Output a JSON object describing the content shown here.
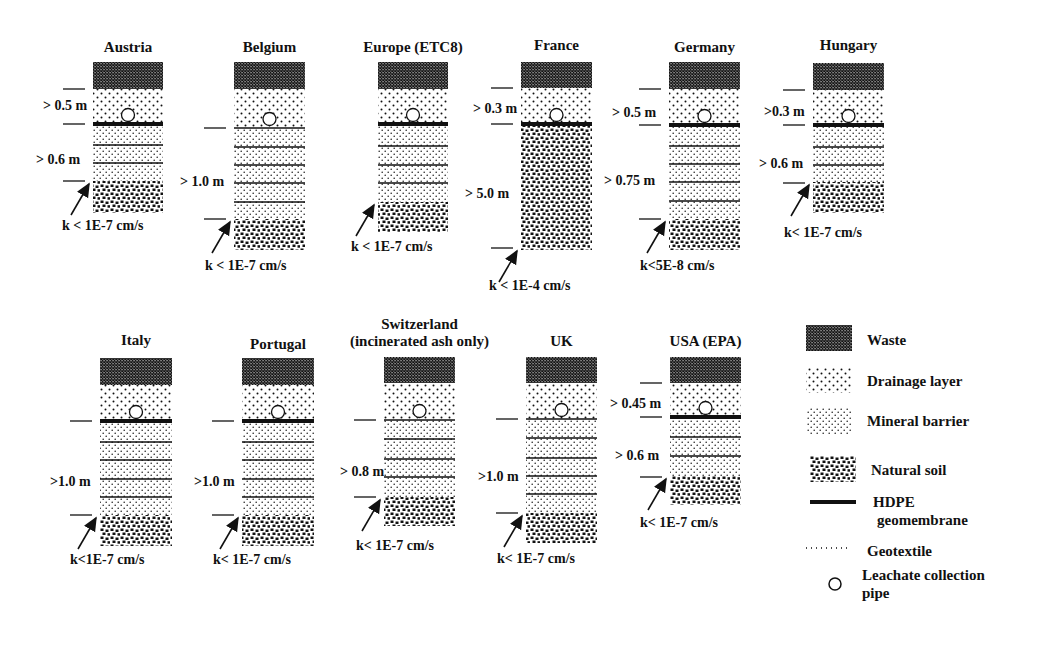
{
  "legend": {
    "items": [
      {
        "key": "waste",
        "label": "Waste",
        "icon": "waste-swatch"
      },
      {
        "key": "drainage",
        "label": "Drainage layer",
        "icon": "drainage-swatch"
      },
      {
        "key": "mineral",
        "label": "Mineral barrier",
        "icon": "mineral-swatch"
      },
      {
        "key": "soil",
        "label": "Natural soil",
        "icon": "soil-swatch"
      },
      {
        "key": "hdpe",
        "label": "HDPE",
        "label2": "geomembrane",
        "icon": "hdpe-line"
      },
      {
        "key": "geotextile",
        "label": "Geotextile",
        "icon": "geotextile-line"
      },
      {
        "key": "pipe",
        "label": "Leachate collection",
        "label2": "pipe",
        "icon": "pipe-circle"
      }
    ]
  },
  "columns": [
    {
      "id": "austria",
      "title": "Austria",
      "x": 93,
      "w": 70,
      "titleY": 52,
      "waste": [
        62,
        89
      ],
      "drainage": [
        89,
        124
      ],
      "mineral": [
        124,
        181
      ],
      "soil": [
        181,
        213
      ],
      "hdpe": true,
      "lines": [
        145,
        163
      ],
      "dims": [
        {
          "label": "> 0.5 m",
          "x": 43,
          "y": 110,
          "lineY1": 89,
          "lineY2": 124
        },
        {
          "label": "> 0.6 m",
          "x": 36,
          "y": 164,
          "lineY2": 181
        }
      ],
      "k": "k < 1E-7 cm/s",
      "kX": 62,
      "kY": 230
    },
    {
      "id": "belgium",
      "title": "Belgium",
      "x": 234,
      "w": 71,
      "titleY": 52,
      "waste": [
        62,
        89
      ],
      "drainage": [
        89,
        128
      ],
      "mineral": [
        128,
        219
      ],
      "soil": [
        219,
        250
      ],
      "hdpe": false,
      "lines": [
        147,
        165,
        183,
        202
      ],
      "dims": [
        {
          "label": "> 1.0 m",
          "x": 180,
          "y": 186,
          "lineY1": 128,
          "lineY2": 219
        }
      ],
      "k": "k < 1E-7 cm/s",
      "kX": 205,
      "kY": 270
    },
    {
      "id": "europe",
      "title": "Europe (ETC8)",
      "x": 378,
      "w": 70,
      "titleY": 52,
      "waste": [
        62,
        89
      ],
      "drainage": [
        89,
        124
      ],
      "mineral": [
        124,
        202
      ],
      "soil": [
        202,
        232
      ],
      "hdpe": true,
      "lines": [
        146,
        165,
        183
      ],
      "dims": [],
      "k": "k < 1E-7 cm/s",
      "kX": 351,
      "kY": 251
    },
    {
      "id": "france",
      "title": "France",
      "x": 521,
      "w": 71,
      "titleY": 50,
      "waste": [
        62,
        88
      ],
      "drainage": [
        88,
        124
      ],
      "mineral": null,
      "soil": [
        124,
        250
      ],
      "hdpe": true,
      "lines": [],
      "dims": [
        {
          "label": "> 0.3 m",
          "x": 473,
          "y": 113,
          "lineY1": 88,
          "lineY2": 124
        },
        {
          "label": "> 5.0 m",
          "x": 465,
          "y": 198,
          "lineY2": 248
        }
      ],
      "k": "k < 1E-4 cm/s",
      "kX": 489,
      "kY": 290
    },
    {
      "id": "germany",
      "title": "Germany",
      "x": 669,
      "w": 71,
      "titleY": 52,
      "waste": [
        62,
        89
      ],
      "drainage": [
        89,
        125
      ],
      "mineral": [
        125,
        219
      ],
      "soil": [
        219,
        250
      ],
      "hdpe": true,
      "lines": [
        146,
        164,
        182,
        201
      ],
      "dims": [
        {
          "label": "> 0.5 m",
          "x": 612,
          "y": 117,
          "lineY1": 89,
          "lineY2": 125
        },
        {
          "label": "> 0.75 m",
          "x": 604,
          "y": 185,
          "lineY2": 219
        }
      ],
      "k": "k<5E-8 cm/s",
      "kX": 640,
      "kY": 270
    },
    {
      "id": "hungary",
      "title": "Hungary",
      "x": 813,
      "w": 71,
      "titleY": 50,
      "waste": [
        63,
        90
      ],
      "drainage": [
        90,
        125
      ],
      "mineral": [
        125,
        182
      ],
      "soil": [
        182,
        213
      ],
      "hdpe": true,
      "lines": [
        147,
        165
      ],
      "dims": [
        {
          "label": ">0.3 m",
          "x": 764,
          "y": 116,
          "lineY1": 90,
          "lineY2": 125
        },
        {
          "label": "> 0.6 m",
          "x": 759,
          "y": 168,
          "lineY2": 183
        }
      ],
      "k": "k< 1E-7 cm/s",
      "kX": 784,
      "kY": 237
    },
    {
      "id": "italy",
      "title": "Italy",
      "x": 100,
      "w": 72,
      "titleY": 345,
      "waste": [
        358,
        385
      ],
      "drainage": [
        385,
        421
      ],
      "mineral": [
        421,
        515
      ],
      "soil": [
        515,
        546
      ],
      "hdpe": true,
      "lines": [
        442,
        460,
        479,
        497
      ],
      "dims": [
        {
          "label": ">1.0 m",
          "x": 50,
          "y": 486,
          "lineY1": 421,
          "lineY2": 515
        }
      ],
      "k": "k<1E-7 cm/s",
      "kX": 70,
      "kY": 564
    },
    {
      "id": "portugal",
      "title": "Portugal",
      "x": 242,
      "w": 72,
      "titleY": 349,
      "waste": [
        358,
        385
      ],
      "drainage": [
        385,
        421
      ],
      "mineral": [
        421,
        515
      ],
      "soil": [
        515,
        546
      ],
      "hdpe": true,
      "lines": [
        442,
        460,
        479,
        497
      ],
      "dims": [
        {
          "label": ">1.0 m",
          "x": 194,
          "y": 486,
          "lineY1": 421,
          "lineY2": 515
        }
      ],
      "k": "k< 1E-7 cm/s",
      "kX": 213,
      "kY": 564
    },
    {
      "id": "switzerland",
      "title": "Switzerland",
      "title2": "(incinerated ash only)",
      "x": 384,
      "w": 71,
      "titleY": 329,
      "title2Y": 346,
      "waste": [
        357,
        383
      ],
      "drainage": [
        383,
        420
      ],
      "mineral": [
        420,
        497
      ],
      "soil": [
        497,
        526
      ],
      "hdpe": false,
      "lines": [
        439,
        459,
        477
      ],
      "dims": [
        {
          "label": "> 0.8 m",
          "x": 340,
          "y": 476,
          "lineY1": 420,
          "lineY2": 497
        }
      ],
      "k": "k< 1E-7 cm/s",
      "kX": 356,
      "kY": 550
    },
    {
      "id": "uk",
      "title": "UK",
      "x": 526,
      "w": 71,
      "titleY": 346,
      "waste": [
        357,
        383
      ],
      "drainage": [
        383,
        419
      ],
      "mineral": [
        419,
        513
      ],
      "soil": [
        513,
        543
      ],
      "hdpe": false,
      "lines": [
        438,
        458,
        476,
        494
      ],
      "dims": [
        {
          "label": ">1.0 m",
          "x": 478,
          "y": 481,
          "lineY1": 419,
          "lineY2": 513
        }
      ],
      "k": "k< 1E-7 cm/s",
      "kX": 497,
      "kY": 563
    },
    {
      "id": "usa",
      "title": "USA (EPA)",
      "x": 670,
      "w": 71,
      "titleY": 346,
      "waste": [
        357,
        383
      ],
      "drainage": [
        383,
        417
      ],
      "mineral": [
        417,
        476
      ],
      "soil": [
        476,
        505
      ],
      "hdpe": true,
      "lines": [
        437,
        456
      ],
      "dims": [
        {
          "label": "> 0.45 m",
          "x": 610,
          "y": 408,
          "lineY1": 383,
          "lineY2": 417
        },
        {
          "label": "> 0.6 m",
          "x": 615,
          "y": 460,
          "lineY2": 477
        }
      ],
      "k": "k< 1E-7 cm/s",
      "kX": 640,
      "kY": 527
    }
  ]
}
